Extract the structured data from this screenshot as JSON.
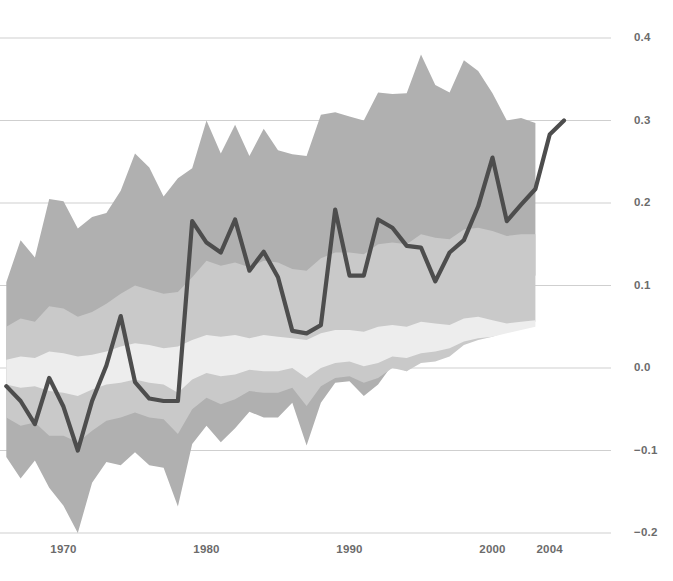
{
  "chart_data": {
    "type": "line",
    "title": "",
    "subtitle": "",
    "xlabel": "",
    "ylabel": "",
    "xlim": [
      1965.6,
      2005.3
    ],
    "ylim": [
      -0.2,
      0.4
    ],
    "grid": true,
    "grid_axis": "y",
    "legend": "none",
    "x_tick_labels": [
      "1970",
      "1980",
      "1990",
      "2000",
      "2004"
    ],
    "x_tick_values": [
      1970,
      1980,
      1990,
      2000,
      2004
    ],
    "y_tick_labels": [
      "0.4",
      "0.3",
      "0.2",
      "0.1",
      "0.0",
      "−0.1",
      "−0.2"
    ],
    "y_tick_values": [
      0.4,
      0.3,
      0.2,
      0.1,
      0.0,
      -0.1,
      -0.2
    ],
    "colors": {
      "line": "#4d4d4d",
      "band_outer": "#b0b0b0",
      "band_middle": "#c9c9c9",
      "band_inner": "#ededed",
      "gridline": "#cfcfcf",
      "axis_text": "#6b6b6b",
      "background": "#ffffff"
    },
    "series": [
      {
        "name": "main-line",
        "kind": "line",
        "x": [
          1966,
          1967,
          1968,
          1969,
          1970,
          1971,
          1972,
          1973,
          1974,
          1975,
          1976,
          1977,
          1978,
          1979,
          1980,
          1981,
          1982,
          1983,
          1984,
          1985,
          1986,
          1987,
          1988,
          1989,
          1990,
          1991,
          1992,
          1993,
          1994,
          1995,
          1996,
          1997,
          1998,
          1999,
          2000,
          2001,
          2002,
          2003,
          2004,
          2005
        ],
        "y": [
          -0.022,
          -0.04,
          -0.068,
          -0.012,
          -0.047,
          -0.1,
          -0.04,
          0.003,
          0.063,
          -0.017,
          -0.037,
          -0.04,
          -0.04,
          0.178,
          0.152,
          0.14,
          0.18,
          0.118,
          0.141,
          0.11,
          0.045,
          0.042,
          0.052,
          0.192,
          0.112,
          0.112,
          0.18,
          0.17,
          0.148,
          0.146,
          0.105,
          0.14,
          0.155,
          0.196,
          0.255,
          0.178,
          0.198,
          0.217,
          0.283,
          0.3
        ]
      },
      {
        "name": "band-outer",
        "kind": "band",
        "x": [
          1966,
          1967,
          1968,
          1969,
          1970,
          1971,
          1972,
          1973,
          1974,
          1975,
          1976,
          1977,
          1978,
          1979,
          1980,
          1981,
          1982,
          1983,
          1984,
          1985,
          1986,
          1987,
          1988,
          1989,
          1990,
          1991,
          1992,
          1993,
          1994,
          1995,
          1996,
          1997,
          1998,
          1999,
          2000,
          2001,
          2002,
          2003
        ],
        "upper": [
          0.104,
          0.155,
          0.134,
          0.205,
          0.202,
          0.169,
          0.183,
          0.188,
          0.215,
          0.26,
          0.243,
          0.208,
          0.23,
          0.242,
          0.3,
          0.26,
          0.295,
          0.257,
          0.29,
          0.264,
          0.259,
          0.257,
          0.307,
          0.31,
          0.305,
          0.3,
          0.334,
          0.332,
          0.333,
          0.38,
          0.343,
          0.334,
          0.373,
          0.36,
          0.333,
          0.3,
          0.303,
          0.297
        ],
        "lower": [
          -0.108,
          -0.134,
          -0.112,
          -0.145,
          -0.167,
          -0.2,
          -0.139,
          -0.114,
          -0.118,
          -0.102,
          -0.118,
          -0.121,
          -0.168,
          -0.092,
          -0.07,
          -0.09,
          -0.073,
          -0.053,
          -0.06,
          -0.06,
          -0.042,
          -0.094,
          -0.042,
          -0.018,
          -0.016,
          -0.034,
          -0.02,
          0.004,
          -0.004,
          0.016,
          0.02,
          0.032,
          0.06,
          0.073,
          0.08,
          0.092,
          0.103,
          0.112
        ]
      },
      {
        "name": "band-middle",
        "kind": "band",
        "x": [
          1966,
          1967,
          1968,
          1969,
          1970,
          1971,
          1972,
          1973,
          1974,
          1975,
          1976,
          1977,
          1978,
          1979,
          1980,
          1981,
          1982,
          1983,
          1984,
          1985,
          1986,
          1987,
          1988,
          1989,
          1990,
          1991,
          1992,
          1993,
          1994,
          1995,
          1996,
          1997,
          1998,
          1999,
          2000,
          2001,
          2002,
          2003
        ],
        "upper": [
          0.05,
          0.06,
          0.056,
          0.075,
          0.072,
          0.062,
          0.068,
          0.078,
          0.09,
          0.1,
          0.095,
          0.09,
          0.092,
          0.11,
          0.13,
          0.124,
          0.128,
          0.122,
          0.13,
          0.128,
          0.12,
          0.118,
          0.133,
          0.14,
          0.14,
          0.138,
          0.15,
          0.152,
          0.15,
          0.162,
          0.158,
          0.156,
          0.168,
          0.17,
          0.166,
          0.16,
          0.162,
          0.162
        ],
        "lower": [
          -0.06,
          -0.07,
          -0.066,
          -0.082,
          -0.082,
          -0.09,
          -0.076,
          -0.064,
          -0.06,
          -0.054,
          -0.06,
          -0.062,
          -0.08,
          -0.05,
          -0.036,
          -0.044,
          -0.038,
          -0.028,
          -0.03,
          -0.03,
          -0.024,
          -0.046,
          -0.022,
          -0.012,
          -0.01,
          -0.018,
          -0.012,
          0.0,
          -0.004,
          0.006,
          0.008,
          0.014,
          0.028,
          0.034,
          0.038,
          0.044,
          0.05,
          0.056
        ]
      },
      {
        "name": "band-inner",
        "kind": "band",
        "x": [
          1966,
          1967,
          1968,
          1969,
          1970,
          1971,
          1972,
          1973,
          1974,
          1975,
          1976,
          1977,
          1978,
          1979,
          1980,
          1981,
          1982,
          1983,
          1984,
          1985,
          1986,
          1987,
          1988,
          1989,
          1990,
          1991,
          1992,
          1993,
          1994,
          1995,
          1996,
          1997,
          1998,
          1999,
          2000,
          2001,
          2002,
          2003
        ],
        "upper": [
          0.01,
          0.014,
          0.012,
          0.02,
          0.018,
          0.014,
          0.016,
          0.02,
          0.026,
          0.03,
          0.028,
          0.024,
          0.026,
          0.034,
          0.04,
          0.038,
          0.04,
          0.036,
          0.04,
          0.038,
          0.036,
          0.034,
          0.042,
          0.046,
          0.046,
          0.044,
          0.05,
          0.052,
          0.05,
          0.056,
          0.054,
          0.052,
          0.06,
          0.062,
          0.058,
          0.054,
          0.056,
          0.058
        ],
        "lower": [
          -0.02,
          -0.024,
          -0.022,
          -0.028,
          -0.03,
          -0.034,
          -0.026,
          -0.02,
          -0.018,
          -0.014,
          -0.018,
          -0.02,
          -0.03,
          -0.014,
          -0.006,
          -0.01,
          -0.008,
          -0.002,
          -0.004,
          -0.004,
          0.0,
          -0.012,
          0.0,
          0.006,
          0.008,
          0.002,
          0.006,
          0.014,
          0.012,
          0.018,
          0.02,
          0.024,
          0.032,
          0.036,
          0.038,
          0.042,
          0.046,
          0.05
        ]
      }
    ]
  },
  "axis": {
    "y_ticks": [
      {
        "label": "0.4",
        "value": 0.4
      },
      {
        "label": "0.3",
        "value": 0.3
      },
      {
        "label": "0.2",
        "value": 0.2
      },
      {
        "label": "0.1",
        "value": 0.1
      },
      {
        "label": "0.0",
        "value": 0.0
      },
      {
        "label": "−0.1",
        "value": -0.1
      },
      {
        "label": "−0.2",
        "value": -0.2
      }
    ],
    "x_ticks": [
      {
        "label": "1970",
        "value": 1970
      },
      {
        "label": "1980",
        "value": 1980
      },
      {
        "label": "1990",
        "value": 1990
      },
      {
        "label": "2000",
        "value": 2000
      },
      {
        "label": "2004",
        "value": 2004
      }
    ]
  }
}
